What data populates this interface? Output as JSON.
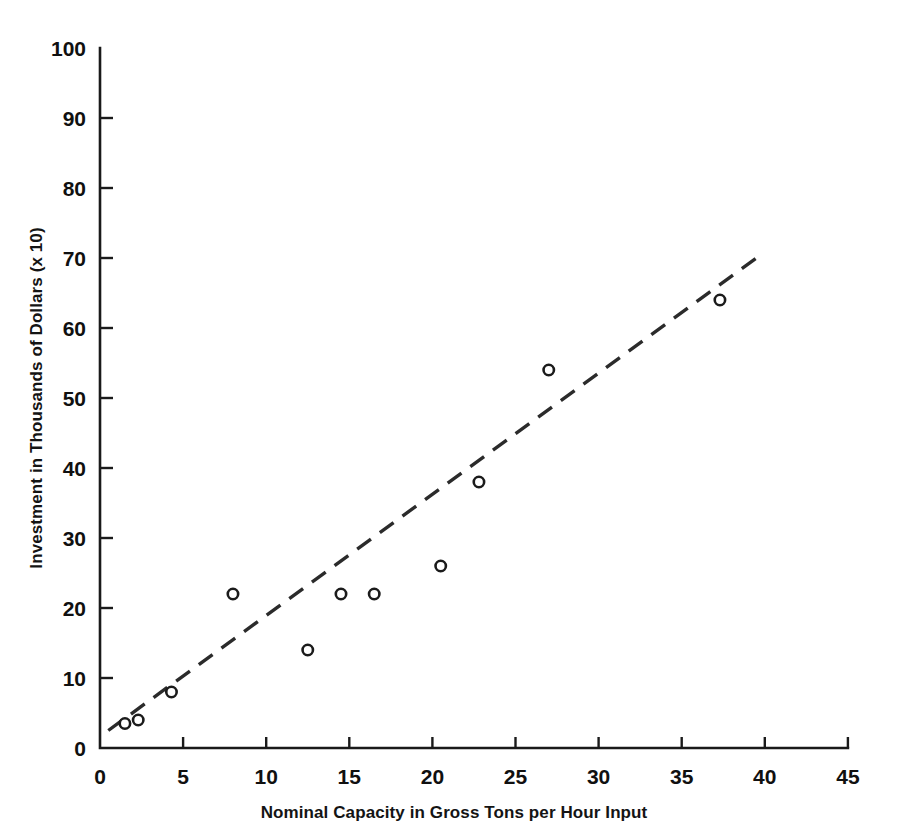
{
  "chart_data": {
    "type": "scatter",
    "title": "",
    "xlabel": "Nominal Capacity in Gross Tons per Hour Input",
    "ylabel": "Investment in Thousands of Dollars (x 10)",
    "xlim": [
      0,
      45
    ],
    "ylim": [
      0,
      100
    ],
    "xticks": [
      0,
      5,
      10,
      15,
      20,
      25,
      30,
      35,
      40,
      45
    ],
    "yticks": [
      0,
      10,
      20,
      30,
      40,
      50,
      60,
      70,
      80,
      90,
      100
    ],
    "xtick_labels": [
      "0",
      "5",
      "10",
      "15",
      "20",
      "25",
      "30",
      "35",
      "40",
      "45"
    ],
    "ytick_labels": [
      "0",
      "10",
      "20",
      "30",
      "40",
      "50",
      "60",
      "70",
      "80",
      "90",
      "100"
    ],
    "grid": false,
    "legend": "none",
    "marker_style": "open-circle",
    "points": [
      {
        "x": 1.5,
        "y": 3.5
      },
      {
        "x": 2.3,
        "y": 4
      },
      {
        "x": 4.3,
        "y": 8
      },
      {
        "x": 8.0,
        "y": 22
      },
      {
        "x": 12.5,
        "y": 14
      },
      {
        "x": 14.5,
        "y": 22
      },
      {
        "x": 16.5,
        "y": 22
      },
      {
        "x": 20.5,
        "y": 26
      },
      {
        "x": 22.8,
        "y": 38
      },
      {
        "x": 27.0,
        "y": 54
      },
      {
        "x": 37.3,
        "y": 64
      }
    ],
    "trend_line": {
      "style": "dashed",
      "x0": 0.5,
      "y0": 2.5,
      "x1": 39.5,
      "y1": 70.0
    }
  },
  "colors": {
    "background": "#ffffff",
    "axis": "#1a1a1a",
    "marker_stroke": "#1b1b1b",
    "marker_fill": "#ffffff",
    "trend": "#2b2b2b",
    "text": "#101010"
  }
}
